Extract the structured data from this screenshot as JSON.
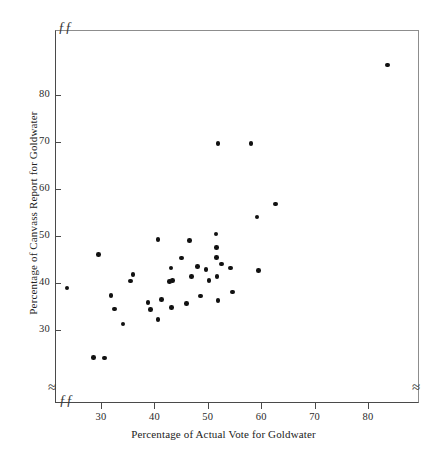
{
  "chart_data": {
    "type": "scatter",
    "title": "",
    "xlabel": "Percentage of Actual Vote for Goldwater",
    "ylabel": "Percentage of Canvass Report for Goldwater",
    "xlim": [
      23,
      90
    ],
    "ylim": [
      23.5,
      89
    ],
    "xticks": [
      30,
      40,
      50,
      60,
      70,
      80
    ],
    "yticks": [
      30,
      40,
      50,
      60,
      70,
      80
    ],
    "xtick_labels": [
      "30",
      "40",
      "50",
      "60",
      "70",
      "80"
    ],
    "ytick_labels": [
      "30",
      "40",
      "50",
      "60",
      "70",
      "80"
    ],
    "grid": false,
    "legend": null,
    "axis_breaks": {
      "left_axis_lower": true,
      "right_axis_lower": true,
      "top_left_corner": true,
      "bottom_left_corner": true,
      "break_glyph_corner": "ƒƒ",
      "break_glyph_axis": "≈"
    },
    "marker": {
      "shape": "circle",
      "filled": true,
      "color": "#111111",
      "size_px": 4.6
    },
    "points": [
      {
        "x": 23.6,
        "y": 38.9
      },
      {
        "x": 28.6,
        "y": 24.2
      },
      {
        "x": 30.6,
        "y": 24.0
      },
      {
        "x": 29.5,
        "y": 46.1
      },
      {
        "x": 31.9,
        "y": 37.4
      },
      {
        "x": 32.5,
        "y": 34.5
      },
      {
        "x": 34.1,
        "y": 31.3
      },
      {
        "x": 36.0,
        "y": 41.8
      },
      {
        "x": 35.5,
        "y": 40.4
      },
      {
        "x": 38.8,
        "y": 35.9
      },
      {
        "x": 39.3,
        "y": 34.3
      },
      {
        "x": 40.7,
        "y": 32.2
      },
      {
        "x": 40.7,
        "y": 49.2
      },
      {
        "x": 41.3,
        "y": 36.5
      },
      {
        "x": 42.8,
        "y": 40.3
      },
      {
        "x": 43.1,
        "y": 43.2
      },
      {
        "x": 43.4,
        "y": 40.5
      },
      {
        "x": 43.2,
        "y": 34.8
      },
      {
        "x": 45.1,
        "y": 45.3
      },
      {
        "x": 46.0,
        "y": 35.6
      },
      {
        "x": 46.6,
        "y": 49.0
      },
      {
        "x": 47.0,
        "y": 41.4
      },
      {
        "x": 48.1,
        "y": 43.5
      },
      {
        "x": 48.6,
        "y": 37.2
      },
      {
        "x": 49.7,
        "y": 42.9
      },
      {
        "x": 50.2,
        "y": 40.5
      },
      {
        "x": 51.5,
        "y": 50.4
      },
      {
        "x": 51.6,
        "y": 47.6
      },
      {
        "x": 51.6,
        "y": 45.4
      },
      {
        "x": 51.7,
        "y": 41.4
      },
      {
        "x": 51.9,
        "y": 36.3
      },
      {
        "x": 51.9,
        "y": 69.7
      },
      {
        "x": 52.6,
        "y": 44.0
      },
      {
        "x": 54.3,
        "y": 43.2
      },
      {
        "x": 54.6,
        "y": 38.1
      },
      {
        "x": 58.1,
        "y": 69.7
      },
      {
        "x": 59.2,
        "y": 54.0
      },
      {
        "x": 59.5,
        "y": 42.6
      },
      {
        "x": 62.7,
        "y": 56.8
      },
      {
        "x": 83.7,
        "y": 86.4
      }
    ]
  }
}
